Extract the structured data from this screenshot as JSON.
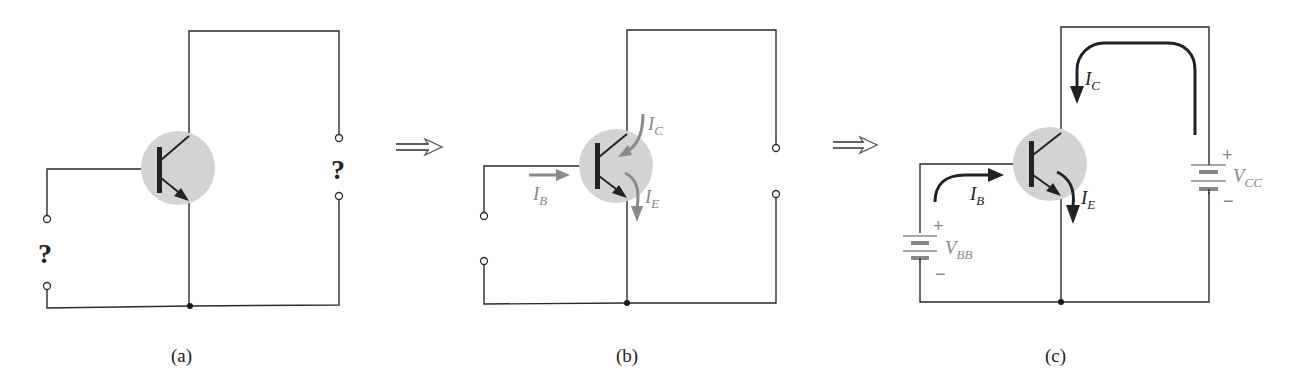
{
  "figure": {
    "panels": [
      {
        "id": "a",
        "caption": "(a)",
        "input_unknown": "?",
        "output_unknown": "?"
      },
      {
        "id": "b",
        "caption": "(b)",
        "currents": {
          "base": {
            "symbol": "I",
            "subscript": "B"
          },
          "collector": {
            "symbol": "I",
            "subscript": "C"
          },
          "emitter": {
            "symbol": "I",
            "subscript": "E"
          }
        },
        "current_arrow_color": "#8a8a8a"
      },
      {
        "id": "c",
        "caption": "(c)",
        "currents": {
          "base": {
            "symbol": "I",
            "subscript": "B"
          },
          "collector": {
            "symbol": "I",
            "subscript": "C"
          },
          "emitter": {
            "symbol": "I",
            "subscript": "E"
          }
        },
        "sources": {
          "base_supply": {
            "symbol": "V",
            "subscript": "BB",
            "plus": "+",
            "minus": "−"
          },
          "collector_supply": {
            "symbol": "V",
            "subscript": "CC",
            "plus": "+",
            "minus": "−"
          }
        },
        "current_arrow_color": "#222222",
        "source_color": "#888888"
      }
    ],
    "transition_arrows": [
      "⟹",
      "⟹"
    ],
    "transistor_fill": "#d3d3d3"
  }
}
